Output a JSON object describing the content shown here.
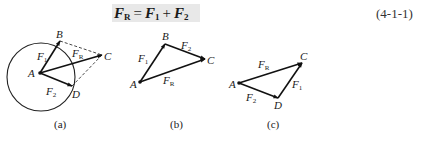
{
  "equation": {
    "lhs": "F",
    "lhs_sub": "R",
    "equals": "=",
    "term1": "F",
    "term1_sub": "1",
    "plus": "+",
    "term2": "F",
    "term2_sub": "2",
    "number": "(4-1-1)"
  },
  "figures": [
    {
      "caption": "(a)",
      "points": {
        "A": "A",
        "B": "B",
        "C": "C",
        "D": "D"
      },
      "vectors": {
        "F1": "F",
        "F1_sub": "1",
        "F2": "F",
        "F2_sub": "2",
        "FR": "F",
        "FR_sub": "R"
      }
    },
    {
      "caption": "(b)",
      "points": {
        "A": "A",
        "B": "B",
        "C": "C"
      },
      "vectors": {
        "F1": "F",
        "F1_sub": "1",
        "F2": "F",
        "F2_sub": "2",
        "FR": "F",
        "FR_sub": "R"
      }
    },
    {
      "caption": "(c)",
      "points": {
        "A": "A",
        "C": "C",
        "D": "D"
      },
      "vectors": {
        "F1": "F",
        "F1_sub": "1",
        "F2": "F",
        "F2_sub": "2",
        "FR": "F",
        "FR_sub": "R"
      }
    }
  ]
}
